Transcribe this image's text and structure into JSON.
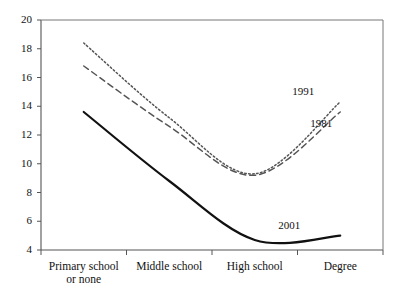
{
  "chart_data": {
    "type": "line",
    "title": "",
    "xlabel": "",
    "ylabel": "",
    "categories": [
      "Primary school or none",
      "Middle school",
      "High school",
      "Degree"
    ],
    "category_lines": [
      [
        "Primary school",
        "or none"
      ],
      [
        "Middle school"
      ],
      [
        "High school"
      ],
      [
        "Degree"
      ]
    ],
    "x": [
      1,
      2,
      3,
      4
    ],
    "ylim": [
      4,
      20
    ],
    "xlim": [
      0.5,
      4.5
    ],
    "yticks": [
      4,
      6,
      8,
      10,
      12,
      14,
      16,
      18,
      20
    ],
    "ytick_labels": [
      "4",
      "6",
      "8",
      "10",
      "12",
      "14",
      "16",
      "18",
      "20"
    ],
    "grid": false,
    "legend_position": "inline-right",
    "series": [
      {
        "name": "1991",
        "style": "dotted",
        "color": "#555555",
        "label_text": "1991",
        "values": [
          18.4,
          13.2,
          9.3,
          14.3
        ]
      },
      {
        "name": "1981",
        "style": "dashed",
        "color": "#555555",
        "label_text": "1981",
        "values": [
          16.8,
          12.6,
          9.2,
          13.6
        ]
      },
      {
        "name": "2001",
        "style": "solid",
        "color": "#111111",
        "label_text": "2001",
        "values": [
          13.6,
          8.8,
          4.7,
          5.0
        ]
      }
    ],
    "annotations": [
      {
        "text": "1991",
        "series": "1991"
      },
      {
        "text": "1981",
        "series": "1981"
      },
      {
        "text": "2001",
        "series": "2001"
      }
    ]
  },
  "axes": {
    "y_axis_name": "value-axis",
    "x_axis_name": "education-level-axis"
  }
}
